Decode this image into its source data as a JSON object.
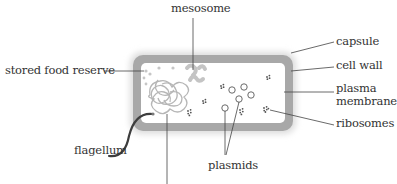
{
  "diagram": {
    "colors": {
      "cell_wall": "#a9a9a9",
      "capsule": "#d9d9d9",
      "interior": "#ffffff",
      "chromosome": "#b5b5b5",
      "mesosome": "#c8c8c8",
      "food_reserve": "#c4c4c4",
      "ribosome": "#555555",
      "plasmid": "#6a6a6a",
      "flagellum": "#3a3a3a",
      "leader_line": "#444444",
      "label_text": "#333333"
    },
    "labels": {
      "mesosome": "mesosome",
      "capsule": "capsule",
      "cell_wall": "cell wall",
      "plasma_membrane_line1": "plasma",
      "plasma_membrane_line2": "membrane",
      "ribosomes": "ribosomes",
      "plasmids": "plasmids",
      "flagellum": "flagellum",
      "stored_food_reserve": "stored food reserve"
    },
    "unlabeled_leaders": [
      {
        "target": "chromosome (nucleoid DNA)",
        "note": "leader line extends to bottom edge, label cropped"
      }
    ]
  }
}
